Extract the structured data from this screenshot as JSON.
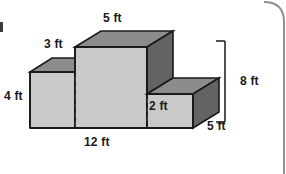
{
  "figure": {
    "colors": {
      "top_face": "#8c8c8c",
      "right_face": "#636363",
      "front_face": "#c9c9c9",
      "outline": "#1a1a1a",
      "label_text": "#1a1a1a",
      "page_border": "#8f8f97",
      "background": "#ffffff"
    },
    "labels": [
      {
        "id": "top-width",
        "text": "5 ft",
        "name": "dimension-label-5ft-top"
      },
      {
        "id": "upper-depth",
        "text": "3 ft",
        "name": "dimension-label-3ft"
      },
      {
        "id": "left-height",
        "text": "4 ft",
        "name": "dimension-label-4ft"
      },
      {
        "id": "step-height",
        "text": "2 ft",
        "name": "dimension-label-2ft"
      },
      {
        "id": "base-width",
        "text": "12 ft",
        "name": "dimension-label-12ft"
      },
      {
        "id": "total-height",
        "text": "8 ft",
        "name": "dimension-label-8ft"
      },
      {
        "id": "right-depth",
        "text": "5 ft",
        "name": "dimension-label-5ft-right"
      }
    ],
    "measurements": {
      "top_width_ft": 5,
      "upper_depth_ft": 3,
      "left_height_ft": 4,
      "step_height_ft": 2,
      "base_width_ft": 12,
      "total_height_ft": 8,
      "right_depth_ft": 5
    }
  }
}
